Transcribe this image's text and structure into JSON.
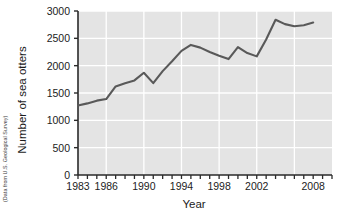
{
  "chart_data": {
    "type": "line",
    "title": "",
    "xlabel": "Year",
    "ylabel": "Number of sea otters",
    "source_note": "(Data from U.S. Geological Survey)",
    "xlim": [
      1983,
      2010
    ],
    "ylim": [
      0,
      3000
    ],
    "ytick_values": [
      0,
      500,
      1000,
      1500,
      2000,
      2500,
      3000
    ],
    "ytick_labels": [
      "0",
      "500",
      "1000",
      "1500",
      "2000",
      "2500",
      "3000"
    ],
    "xtick_values": [
      1983,
      1984,
      1985,
      1986,
      1987,
      1988,
      1989,
      1990,
      1991,
      1992,
      1993,
      1994,
      1995,
      1996,
      1997,
      1998,
      1999,
      2000,
      2001,
      2002,
      2003,
      2004,
      2005,
      2006,
      2007,
      2008,
      2009,
      2010
    ],
    "xtick_labeled": [
      {
        "value": 1983,
        "label": "1983"
      },
      {
        "value": 1986,
        "label": "1986"
      },
      {
        "value": 1990,
        "label": "1990"
      },
      {
        "value": 1994,
        "label": "1994"
      },
      {
        "value": 1998,
        "label": "1998"
      },
      {
        "value": 2002,
        "label": "2002"
      },
      {
        "value": 2008,
        "label": "2008"
      }
    ],
    "grid": true,
    "grid_color": "#ffffff",
    "plot_background": "#e4e4e4",
    "line_color": "#595959",
    "legend": null,
    "x": [
      1983,
      1984,
      1985,
      1986,
      1987,
      1988,
      1989,
      1990,
      1991,
      1992,
      1993,
      1994,
      1995,
      1996,
      1997,
      1998,
      1999,
      2000,
      2001,
      2002,
      2003,
      2004,
      2005,
      2006,
      2007,
      2008
    ],
    "values": [
      1270,
      1310,
      1360,
      1390,
      1620,
      1680,
      1730,
      1870,
      1680,
      1900,
      2080,
      2270,
      2380,
      2330,
      2250,
      2180,
      2120,
      2340,
      2230,
      2170,
      2480,
      2840,
      2760,
      2720,
      2740,
      2790
    ],
    "series": [
      {
        "name": "Number of sea otters",
        "values": [
          1270,
          1310,
          1360,
          1390,
          1620,
          1680,
          1730,
          1870,
          1680,
          1900,
          2080,
          2270,
          2380,
          2330,
          2250,
          2180,
          2120,
          2340,
          2230,
          2170,
          2480,
          2840,
          2760,
          2720,
          2740,
          2790
        ]
      }
    ]
  }
}
